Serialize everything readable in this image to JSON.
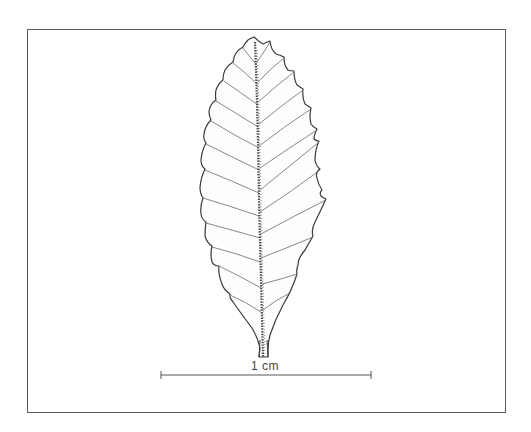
{
  "figure": {
    "scale_bar": {
      "label": "1 cm"
    }
  },
  "colors": {
    "frame": "#5a5a5a",
    "outline": "#3a3a3a",
    "veins": "#6a6a6a",
    "midrib": "#4a4a4a",
    "background": "#ffffff"
  }
}
